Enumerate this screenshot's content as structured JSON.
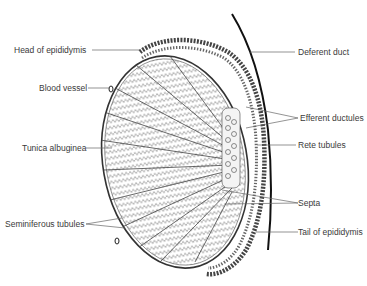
{
  "diagram": {
    "colors": {
      "ink": "#222222",
      "label": "#3a3a3a",
      "background": "#ffffff"
    },
    "labels_left": [
      {
        "id": "head-of-epididymis",
        "text": "Head of epididymis"
      },
      {
        "id": "blood-vessel",
        "text": "Blood vessel"
      },
      {
        "id": "tunica-albuginea",
        "text": "Tunica albuginea"
      },
      {
        "id": "seminiferous-tubules",
        "text": "Seminiferous tubules"
      }
    ],
    "labels_right": [
      {
        "id": "deferent-duct",
        "text": "Deferent duct"
      },
      {
        "id": "efferent-ductules",
        "text": "Efferent ductules"
      },
      {
        "id": "rete-tubules",
        "text": "Rete tubules"
      },
      {
        "id": "septa",
        "text": "Septa"
      },
      {
        "id": "tail-of-epididymis",
        "text": "Tail of epididymis"
      }
    ]
  }
}
